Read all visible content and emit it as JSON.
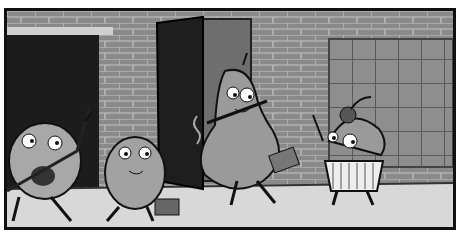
{
  "image": {
    "kind": "comic-panel",
    "style": "grayscale cartoon",
    "scene": "Four bean-shaped characters on a sidewalk in front of a brick building with open doors",
    "colors": {
      "border": "#111111",
      "brick_wall": "#8a8a8a",
      "mortar": "#c8c8c8",
      "door": "#1e1e1e",
      "sidewalk": "#d6d6d6",
      "window_grid": "#7a7a7a",
      "character_body": "#9a9a9a",
      "eye_white": "#ffffff"
    },
    "characters": [
      {
        "id": "guitar-bean",
        "description": "round bean with ukulele strapped across body, waving"
      },
      {
        "id": "briefcase-bean",
        "description": "egg-shaped bean smiling, carrying a small briefcase"
      },
      {
        "id": "pear-bean",
        "description": "pear-shaped bean emerging from open door, carrying a bag"
      },
      {
        "id": "cherry-cupcake-bean",
        "description": "round bean with cherry stem on head, wearing cupcake wrapper, waving"
      }
    ]
  }
}
